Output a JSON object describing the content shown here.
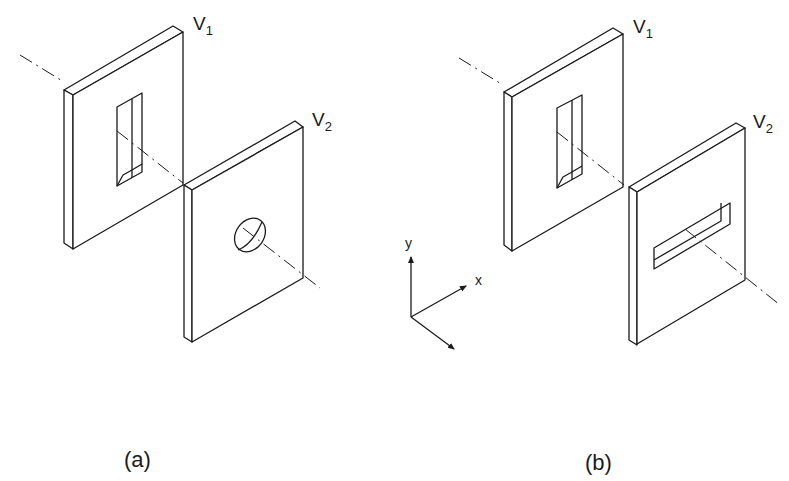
{
  "figure": {
    "panels": [
      {
        "caption": "(a)",
        "plate1": {
          "label": "V",
          "subscript": "1",
          "aperture": "vertical rectangular slit"
        },
        "plate2": {
          "label": "V",
          "subscript": "2",
          "aperture": "circular hole"
        }
      },
      {
        "caption": "(b)",
        "plate1": {
          "label": "V",
          "subscript": "1",
          "aperture": "vertical rectangular slit"
        },
        "plate2": {
          "label": "V",
          "subscript": "2",
          "aperture": "horizontal rectangular slit"
        }
      }
    ],
    "axes": {
      "y_label": "y",
      "x_label": "x"
    },
    "colors": {
      "line": "#1a1a1a",
      "background": "#ffffff"
    }
  }
}
